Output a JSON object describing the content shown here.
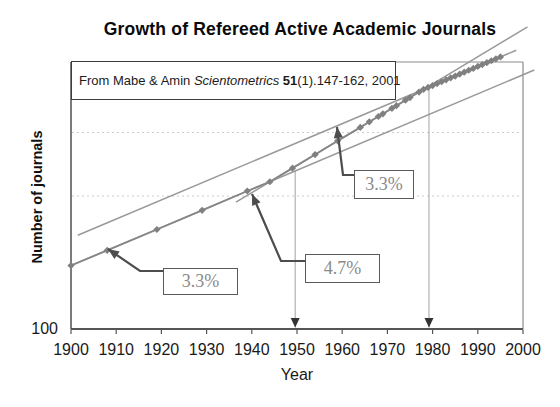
{
  "title": "Growth of Refereed Active Academic Journals",
  "citation": {
    "prefix": "From Mabe & Amin",
    "journal": "Scientometrics",
    "volume": "51",
    "suffix": "(1).147-162, 2001"
  },
  "chart_data": {
    "type": "scatter",
    "subtype": "semilog-growth",
    "title": "Growth of Refereed Active Academic Journals",
    "xlabel": "Year",
    "ylabel": "Number of journals",
    "x_ticks": [
      1900,
      1910,
      1920,
      1930,
      1940,
      1950,
      1960,
      1970,
      1980,
      1990,
      2000
    ],
    "x_range": [
      1900,
      2000
    ],
    "y_axis": {
      "scale": "log",
      "bottom_value": 100,
      "bottom_label": "100",
      "gridline_values": [
        1000,
        3000
      ],
      "grid_style": "dotted"
    },
    "points": [
      [
        1900,
        300
      ],
      [
        1908,
        390
      ],
      [
        1919,
        560
      ],
      [
        1929,
        780
      ],
      [
        1939,
        1090
      ],
      [
        1944,
        1280
      ],
      [
        1949,
        1620
      ],
      [
        1954,
        2050
      ],
      [
        1959,
        2600
      ],
      [
        1964,
        3280
      ],
      [
        1966,
        3610
      ],
      [
        1968,
        3960
      ],
      [
        1969,
        4150
      ],
      [
        1971,
        4560
      ],
      [
        1972,
        4780
      ],
      [
        1974,
        5250
      ],
      [
        1975,
        5500
      ],
      [
        1977,
        6050
      ],
      [
        1978,
        6340
      ],
      [
        1979,
        6550
      ],
      [
        1980,
        6770
      ],
      [
        1981,
        7000
      ],
      [
        1982,
        7230
      ],
      [
        1983,
        7470
      ],
      [
        1984,
        7730
      ],
      [
        1985,
        7980
      ],
      [
        1986,
        8250
      ],
      [
        1987,
        8530
      ],
      [
        1988,
        8820
      ],
      [
        1989,
        9110
      ],
      [
        1990,
        9420
      ],
      [
        1991,
        9730
      ],
      [
        1992,
        10060
      ],
      [
        1993,
        10400
      ],
      [
        1994,
        10750
      ],
      [
        1995,
        11110
      ]
    ],
    "trend_lines": [
      {
        "name": "early-growth",
        "rate_label": "3.3%",
        "endpoints": [
          [
            1900,
            300
          ],
          [
            2002.5,
            8850
          ]
        ]
      },
      {
        "name": "mid-growth",
        "rate_label": "4.7%",
        "endpoints": [
          [
            1936.5,
            900
          ],
          [
            2001,
            18680
          ]
        ]
      },
      {
        "name": "late-growth",
        "rate_label": "3.3%",
        "endpoints": [
          [
            1901.5,
            507
          ],
          [
            1998.5,
            12470
          ]
        ]
      }
    ],
    "annotations": [
      {
        "label": "3.3%",
        "target": "early-growth",
        "box_px": {
          "x": 163,
          "y": 268,
          "w": 75,
          "h": 27
        },
        "leader_px": [
          [
            108,
            249
          ],
          [
            140,
            271
          ],
          [
            163,
            271
          ]
        ]
      },
      {
        "label": "4.7%",
        "target": "mid-growth",
        "box_px": {
          "x": 305,
          "y": 254,
          "w": 75,
          "h": 29
        },
        "leader_px": [
          [
            252,
            194
          ],
          [
            281,
            261
          ],
          [
            305,
            261
          ]
        ]
      },
      {
        "label": "3.3%",
        "target": "late-growth",
        "box_px": {
          "x": 354,
          "y": 170,
          "w": 60,
          "h": 29
        },
        "leader_px": [
          [
            337,
            127
          ],
          [
            343,
            175
          ],
          [
            354,
            175
          ]
        ]
      }
    ],
    "transition_markers": [
      {
        "year": 1949.6,
        "top_px": 171
      },
      {
        "year": 1979.2,
        "top_px": 90
      }
    ],
    "colors": {
      "series": "#868686",
      "trend": "#999999",
      "marker_line": "#aaaaaa",
      "marker_arrow": "#333333",
      "leader": "#4d4d4d",
      "grid": "#cccccc",
      "border": "#8c8c8c",
      "axis": "#555555",
      "pct_text": "#8a8a8a"
    }
  }
}
